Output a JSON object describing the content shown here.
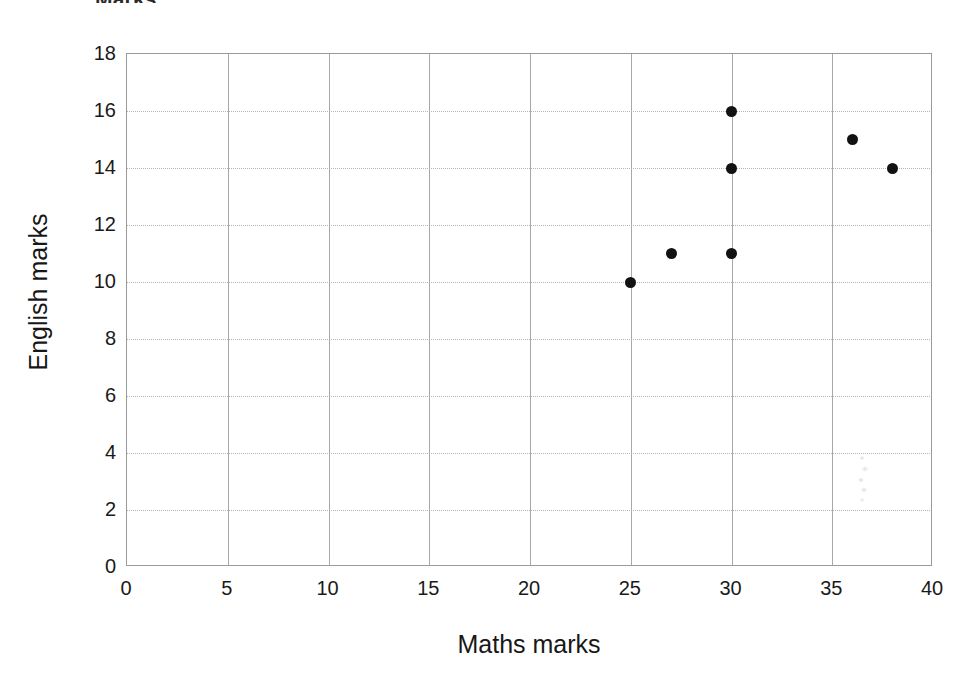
{
  "chart_data": {
    "type": "scatter",
    "title": "",
    "xlabel": "Maths marks",
    "ylabel": "English marks",
    "xlim": [
      0,
      40
    ],
    "ylim": [
      0,
      18
    ],
    "xticks": [
      "0",
      "5",
      "10",
      "15",
      "20",
      "25",
      "30",
      "35",
      "40"
    ],
    "yticks": [
      "0",
      "2",
      "4",
      "6",
      "8",
      "10",
      "12",
      "14",
      "16",
      "18"
    ],
    "xtick_values": [
      0,
      5,
      10,
      15,
      20,
      25,
      30,
      35,
      40
    ],
    "ytick_values": [
      0,
      2,
      4,
      6,
      8,
      10,
      12,
      14,
      16,
      18
    ],
    "grid": true,
    "legend": "none",
    "marker_color": "#121212",
    "grid_color": "#b4b4b4",
    "axis_color": "#9a9a9a",
    "points": [
      {
        "x": 25,
        "y": 10
      },
      {
        "x": 27,
        "y": 11
      },
      {
        "x": 30,
        "y": 11
      },
      {
        "x": 30,
        "y": 14
      },
      {
        "x": 30,
        "y": 16
      },
      {
        "x": 36,
        "y": 15
      },
      {
        "x": 38,
        "y": 14
      }
    ]
  },
  "figure": {
    "title_crop_text": "Marks",
    "artifact_label": "scan-smudge"
  }
}
